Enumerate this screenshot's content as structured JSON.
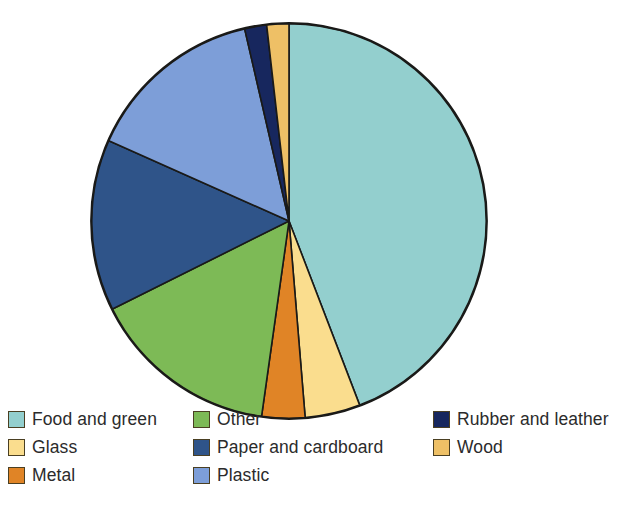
{
  "chart_data": {
    "type": "pie",
    "title": "",
    "subtitle": "",
    "xlabel": "",
    "ylabel": "",
    "legend_position": "bottom",
    "grid": false,
    "units": "percent",
    "start_angle_deg": 0,
    "direction": "clockwise",
    "categories": [
      "Food and green",
      "Glass",
      "Metal",
      "Other",
      "Paper and cardboard",
      "Plastic",
      "Rubber and leather",
      "Wood"
    ],
    "values": [
      44.2,
      4.5,
      3.5,
      15.4,
      14.0,
      14.7,
      1.8,
      1.8
    ],
    "colors": [
      "#93cfce",
      "#fadd8e",
      "#e08426",
      "#7dba56",
      "#2f5489",
      "#7d9ed8",
      "#17275e",
      "#eec066"
    ],
    "slices": [
      {
        "label": "Food and green",
        "value": 44.2,
        "angle_deg": 159.0,
        "color": "#93cfce"
      },
      {
        "label": "Glass",
        "value": 4.5,
        "angle_deg": 16.3,
        "color": "#fadd8e"
      },
      {
        "label": "Metal",
        "value": 3.5,
        "angle_deg": 12.7,
        "color": "#e08426"
      },
      {
        "label": "Other",
        "value": 15.4,
        "angle_deg": 55.5,
        "color": "#7dba56"
      },
      {
        "label": "Paper and cardboard",
        "value": 14.0,
        "angle_deg": 50.5,
        "color": "#2f5489"
      },
      {
        "label": "Plastic",
        "value": 14.7,
        "angle_deg": 53.0,
        "color": "#7d9ed8"
      },
      {
        "label": "Rubber and leather",
        "value": 1.8,
        "angle_deg": 6.5,
        "color": "#17275e"
      },
      {
        "label": "Wood",
        "value": 1.8,
        "angle_deg": 6.5,
        "color": "#eec066"
      }
    ]
  },
  "legend": {
    "columns": [
      {
        "items": [
          {
            "label": "Food and green",
            "color": "#93cfce"
          },
          {
            "label": "Glass",
            "color": "#fadd8e"
          },
          {
            "label": "Metal",
            "color": "#e08426"
          }
        ]
      },
      {
        "items": [
          {
            "label": "Other",
            "color": "#7dba56"
          },
          {
            "label": "Paper and cardboard",
            "color": "#2f5489"
          },
          {
            "label": "Plastic",
            "color": "#7d9ed8"
          }
        ]
      },
      {
        "items": [
          {
            "label": "Rubber and leather",
            "color": "#17275e"
          },
          {
            "label": "Wood",
            "color": "#eec066"
          }
        ]
      }
    ]
  }
}
